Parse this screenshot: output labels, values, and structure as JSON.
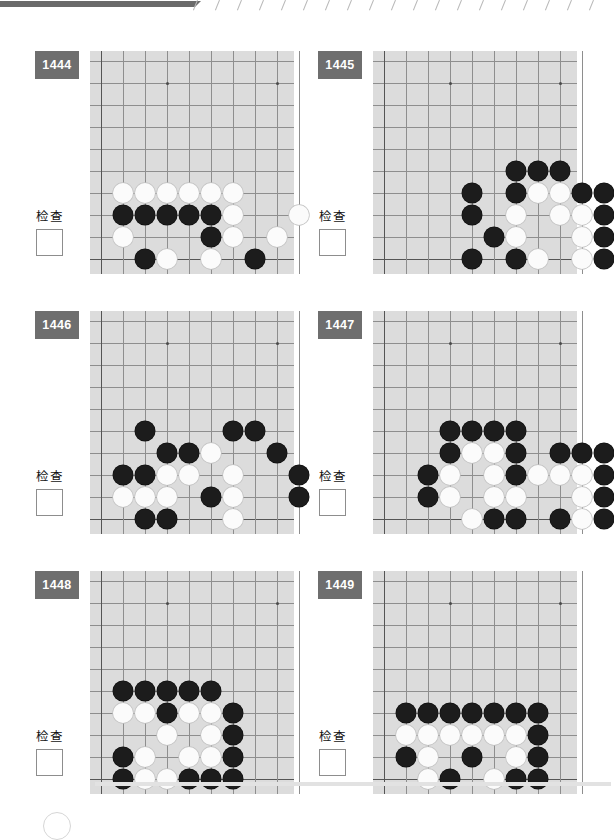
{
  "page": {
    "check_label": "检查",
    "board": {
      "cols": 9,
      "rows": 10,
      "cell": 22,
      "origin_x": 11,
      "origin_y": 10,
      "star_points": [
        [
          3,
          1
        ],
        [
          8,
          1
        ]
      ]
    },
    "top_strip": {
      "tick_count": 19
    }
  },
  "puzzles": [
    {
      "number": "1444",
      "check_label": "检查",
      "checkbox_checked": false,
      "stones": [
        {
          "c": 1,
          "r": 6,
          "color": "w"
        },
        {
          "c": 2,
          "r": 6,
          "color": "w"
        },
        {
          "c": 3,
          "r": 6,
          "color": "w"
        },
        {
          "c": 4,
          "r": 6,
          "color": "w"
        },
        {
          "c": 5,
          "r": 6,
          "color": "w"
        },
        {
          "c": 6,
          "r": 6,
          "color": "w"
        },
        {
          "c": 1,
          "r": 7,
          "color": "b"
        },
        {
          "c": 2,
          "r": 7,
          "color": "b"
        },
        {
          "c": 3,
          "r": 7,
          "color": "b"
        },
        {
          "c": 4,
          "r": 7,
          "color": "b"
        },
        {
          "c": 5,
          "r": 7,
          "color": "b"
        },
        {
          "c": 6,
          "r": 7,
          "color": "w"
        },
        {
          "c": 9,
          "r": 7,
          "color": "w"
        },
        {
          "c": 1,
          "r": 8,
          "color": "w"
        },
        {
          "c": 5,
          "r": 8,
          "color": "b"
        },
        {
          "c": 6,
          "r": 8,
          "color": "w"
        },
        {
          "c": 8,
          "r": 8,
          "color": "w"
        },
        {
          "c": 2,
          "r": 9,
          "color": "b"
        },
        {
          "c": 3,
          "r": 9,
          "color": "w"
        },
        {
          "c": 5,
          "r": 9,
          "color": "w"
        },
        {
          "c": 7,
          "r": 9,
          "color": "b"
        }
      ]
    },
    {
      "number": "1445",
      "check_label": "检查",
      "checkbox_checked": false,
      "stones": [
        {
          "c": 6,
          "r": 5,
          "color": "b"
        },
        {
          "c": 7,
          "r": 5,
          "color": "b"
        },
        {
          "c": 8,
          "r": 5,
          "color": "b"
        },
        {
          "c": 4,
          "r": 6,
          "color": "b"
        },
        {
          "c": 6,
          "r": 6,
          "color": "b"
        },
        {
          "c": 7,
          "r": 6,
          "color": "w"
        },
        {
          "c": 8,
          "r": 6,
          "color": "w"
        },
        {
          "c": 9,
          "r": 6,
          "color": "b"
        },
        {
          "c": 10,
          "r": 6,
          "color": "b"
        },
        {
          "c": 4,
          "r": 7,
          "color": "b"
        },
        {
          "c": 6,
          "r": 7,
          "color": "w"
        },
        {
          "c": 8,
          "r": 7,
          "color": "w"
        },
        {
          "c": 9,
          "r": 7,
          "color": "w"
        },
        {
          "c": 10,
          "r": 7,
          "color": "b"
        },
        {
          "c": 5,
          "r": 8,
          "color": "b"
        },
        {
          "c": 6,
          "r": 8,
          "color": "w"
        },
        {
          "c": 9,
          "r": 8,
          "color": "w"
        },
        {
          "c": 10,
          "r": 8,
          "color": "b"
        },
        {
          "c": 4,
          "r": 9,
          "color": "b"
        },
        {
          "c": 6,
          "r": 9,
          "color": "b"
        },
        {
          "c": 7,
          "r": 9,
          "color": "w"
        },
        {
          "c": 9,
          "r": 9,
          "color": "w"
        },
        {
          "c": 10,
          "r": 9,
          "color": "b"
        }
      ]
    },
    {
      "number": "1446",
      "check_label": "检查",
      "checkbox_checked": false,
      "stones": [
        {
          "c": 2,
          "r": 5,
          "color": "b"
        },
        {
          "c": 6,
          "r": 5,
          "color": "b"
        },
        {
          "c": 7,
          "r": 5,
          "color": "b"
        },
        {
          "c": 3,
          "r": 6,
          "color": "b"
        },
        {
          "c": 4,
          "r": 6,
          "color": "b"
        },
        {
          "c": 5,
          "r": 6,
          "color": "w"
        },
        {
          "c": 8,
          "r": 6,
          "color": "b"
        },
        {
          "c": 1,
          "r": 7,
          "color": "b"
        },
        {
          "c": 2,
          "r": 7,
          "color": "b"
        },
        {
          "c": 3,
          "r": 7,
          "color": "w"
        },
        {
          "c": 4,
          "r": 7,
          "color": "w"
        },
        {
          "c": 6,
          "r": 7,
          "color": "w"
        },
        {
          "c": 9,
          "r": 7,
          "color": "b"
        },
        {
          "c": 1,
          "r": 8,
          "color": "w"
        },
        {
          "c": 2,
          "r": 8,
          "color": "w"
        },
        {
          "c": 3,
          "r": 8,
          "color": "w"
        },
        {
          "c": 5,
          "r": 8,
          "color": "b"
        },
        {
          "c": 6,
          "r": 8,
          "color": "w"
        },
        {
          "c": 9,
          "r": 8,
          "color": "b"
        },
        {
          "c": 2,
          "r": 9,
          "color": "b"
        },
        {
          "c": 3,
          "r": 9,
          "color": "b"
        },
        {
          "c": 6,
          "r": 9,
          "color": "w"
        }
      ]
    },
    {
      "number": "1447",
      "check_label": "检查",
      "checkbox_checked": false,
      "stones": [
        {
          "c": 3,
          "r": 5,
          "color": "b"
        },
        {
          "c": 4,
          "r": 5,
          "color": "b"
        },
        {
          "c": 5,
          "r": 5,
          "color": "b"
        },
        {
          "c": 6,
          "r": 5,
          "color": "b"
        },
        {
          "c": 3,
          "r": 6,
          "color": "b"
        },
        {
          "c": 4,
          "r": 6,
          "color": "w"
        },
        {
          "c": 5,
          "r": 6,
          "color": "w"
        },
        {
          "c": 6,
          "r": 6,
          "color": "b"
        },
        {
          "c": 8,
          "r": 6,
          "color": "b"
        },
        {
          "c": 9,
          "r": 6,
          "color": "b"
        },
        {
          "c": 10,
          "r": 6,
          "color": "b"
        },
        {
          "c": 2,
          "r": 7,
          "color": "b"
        },
        {
          "c": 3,
          "r": 7,
          "color": "w"
        },
        {
          "c": 5,
          "r": 7,
          "color": "w"
        },
        {
          "c": 6,
          "r": 7,
          "color": "b"
        },
        {
          "c": 7,
          "r": 7,
          "color": "w"
        },
        {
          "c": 8,
          "r": 7,
          "color": "w"
        },
        {
          "c": 9,
          "r": 7,
          "color": "w"
        },
        {
          "c": 10,
          "r": 7,
          "color": "b"
        },
        {
          "c": 2,
          "r": 8,
          "color": "b"
        },
        {
          "c": 3,
          "r": 8,
          "color": "w"
        },
        {
          "c": 5,
          "r": 8,
          "color": "w"
        },
        {
          "c": 6,
          "r": 8,
          "color": "w"
        },
        {
          "c": 9,
          "r": 8,
          "color": "w"
        },
        {
          "c": 10,
          "r": 8,
          "color": "b"
        },
        {
          "c": 4,
          "r": 9,
          "color": "w"
        },
        {
          "c": 5,
          "r": 9,
          "color": "b"
        },
        {
          "c": 6,
          "r": 9,
          "color": "b"
        },
        {
          "c": 8,
          "r": 9,
          "color": "b"
        },
        {
          "c": 9,
          "r": 9,
          "color": "w"
        },
        {
          "c": 10,
          "r": 9,
          "color": "b"
        }
      ]
    },
    {
      "number": "1448",
      "check_label": "检查",
      "checkbox_checked": false,
      "stones": [
        {
          "c": 1,
          "r": 5,
          "color": "b"
        },
        {
          "c": 2,
          "r": 5,
          "color": "b"
        },
        {
          "c": 3,
          "r": 5,
          "color": "b"
        },
        {
          "c": 4,
          "r": 5,
          "color": "b"
        },
        {
          "c": 5,
          "r": 5,
          "color": "b"
        },
        {
          "c": 1,
          "r": 6,
          "color": "w"
        },
        {
          "c": 2,
          "r": 6,
          "color": "w"
        },
        {
          "c": 3,
          "r": 6,
          "color": "b"
        },
        {
          "c": 4,
          "r": 6,
          "color": "w"
        },
        {
          "c": 5,
          "r": 6,
          "color": "w"
        },
        {
          "c": 6,
          "r": 6,
          "color": "b"
        },
        {
          "c": 3,
          "r": 7,
          "color": "w"
        },
        {
          "c": 5,
          "r": 7,
          "color": "w"
        },
        {
          "c": 6,
          "r": 7,
          "color": "b"
        },
        {
          "c": 1,
          "r": 8,
          "color": "b"
        },
        {
          "c": 2,
          "r": 8,
          "color": "w"
        },
        {
          "c": 4,
          "r": 8,
          "color": "w"
        },
        {
          "c": 5,
          "r": 8,
          "color": "w"
        },
        {
          "c": 6,
          "r": 8,
          "color": "b"
        },
        {
          "c": 1,
          "r": 9,
          "color": "b"
        },
        {
          "c": 2,
          "r": 9,
          "color": "w"
        },
        {
          "c": 3,
          "r": 9,
          "color": "w"
        },
        {
          "c": 4,
          "r": 9,
          "color": "b"
        },
        {
          "c": 5,
          "r": 9,
          "color": "b"
        },
        {
          "c": 6,
          "r": 9,
          "color": "b"
        }
      ]
    },
    {
      "number": "1449",
      "check_label": "检查",
      "checkbox_checked": false,
      "stones": [
        {
          "c": 1,
          "r": 6,
          "color": "b"
        },
        {
          "c": 2,
          "r": 6,
          "color": "b"
        },
        {
          "c": 3,
          "r": 6,
          "color": "b"
        },
        {
          "c": 4,
          "r": 6,
          "color": "b"
        },
        {
          "c": 5,
          "r": 6,
          "color": "b"
        },
        {
          "c": 6,
          "r": 6,
          "color": "b"
        },
        {
          "c": 7,
          "r": 6,
          "color": "b"
        },
        {
          "c": 1,
          "r": 7,
          "color": "w"
        },
        {
          "c": 2,
          "r": 7,
          "color": "w"
        },
        {
          "c": 3,
          "r": 7,
          "color": "w"
        },
        {
          "c": 4,
          "r": 7,
          "color": "w"
        },
        {
          "c": 5,
          "r": 7,
          "color": "w"
        },
        {
          "c": 6,
          "r": 7,
          "color": "w"
        },
        {
          "c": 7,
          "r": 7,
          "color": "b"
        },
        {
          "c": 1,
          "r": 8,
          "color": "b"
        },
        {
          "c": 2,
          "r": 8,
          "color": "w"
        },
        {
          "c": 4,
          "r": 8,
          "color": "b"
        },
        {
          "c": 6,
          "r": 8,
          "color": "w"
        },
        {
          "c": 7,
          "r": 8,
          "color": "b"
        },
        {
          "c": 2,
          "r": 9,
          "color": "w"
        },
        {
          "c": 3,
          "r": 9,
          "color": "b"
        },
        {
          "c": 5,
          "r": 9,
          "color": "w"
        },
        {
          "c": 6,
          "r": 9,
          "color": "b"
        },
        {
          "c": 7,
          "r": 9,
          "color": "b"
        }
      ]
    }
  ]
}
